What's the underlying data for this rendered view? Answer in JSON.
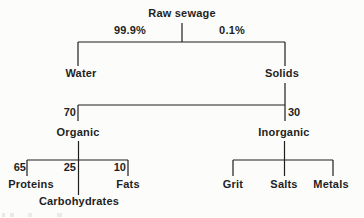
{
  "tree": {
    "label": "Raw sewage",
    "children": [
      {
        "label": "Water",
        "edge_value": "99.9%"
      },
      {
        "label": "Solids",
        "edge_value": "0.1%",
        "children": [
          {
            "label": "Organic",
            "edge_value": "70",
            "children": [
              {
                "label": "Proteins",
                "edge_value": "65"
              },
              {
                "label": "Carbohydrates",
                "edge_value": "25"
              },
              {
                "label": "Fats",
                "edge_value": "10"
              }
            ]
          },
          {
            "label": "Inorganic",
            "edge_value": "30",
            "children": [
              {
                "label": "Grit"
              },
              {
                "label": "Salts"
              },
              {
                "label": "Metals"
              }
            ]
          }
        ]
      }
    ]
  },
  "colors": {
    "ink": "#1f1f1f",
    "background": "#fcfcfa"
  }
}
